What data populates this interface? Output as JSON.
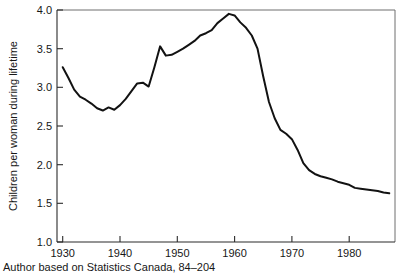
{
  "chart_data": {
    "type": "line",
    "title": "",
    "subtitle": "",
    "xlabel": "",
    "ylabel": "Children per woman during lifetime",
    "xlim": [
      1929,
      1988
    ],
    "ylim": [
      1.0,
      4.0
    ],
    "grid": false,
    "legend": "none",
    "line_color": "#121212",
    "axis_color": "#2b2b2b",
    "background_color": "#ffffff",
    "x_ticks": [
      1930,
      1940,
      1950,
      1960,
      1970,
      1980
    ],
    "x_tick_labels": [
      "1930",
      "1940",
      "1950",
      "1960",
      "1970",
      "1980"
    ],
    "y_ticks": [
      1.0,
      1.5,
      2.0,
      2.5,
      3.0,
      3.5,
      4.0
    ],
    "y_tick_labels": [
      "1.0",
      "1.5",
      "2.0",
      "2.5",
      "3.0",
      "3.5",
      "4.0"
    ],
    "series": [
      {
        "name": "Total fertility rate",
        "x": [
          1930,
          1931,
          1932,
          1933,
          1934,
          1935,
          1936,
          1937,
          1938,
          1939,
          1940,
          1941,
          1942,
          1943,
          1944,
          1945,
          1946,
          1947,
          1948,
          1949,
          1950,
          1951,
          1952,
          1953,
          1954,
          1955,
          1956,
          1957,
          1958,
          1959,
          1960,
          1961,
          1962,
          1963,
          1964,
          1965,
          1966,
          1967,
          1968,
          1969,
          1970,
          1971,
          1972,
          1973,
          1974,
          1975,
          1976,
          1977,
          1978,
          1979,
          1980,
          1981,
          1982,
          1983,
          1984,
          1985,
          1986,
          1987
        ],
        "y": [
          3.26,
          3.12,
          2.97,
          2.88,
          2.84,
          2.79,
          2.73,
          2.7,
          2.74,
          2.71,
          2.77,
          2.85,
          2.95,
          3.05,
          3.06,
          3.01,
          3.26,
          3.53,
          3.41,
          3.42,
          3.46,
          3.5,
          3.55,
          3.6,
          3.67,
          3.7,
          3.74,
          3.83,
          3.89,
          3.95,
          3.93,
          3.84,
          3.77,
          3.67,
          3.5,
          3.14,
          2.81,
          2.6,
          2.45,
          2.4,
          2.33,
          2.19,
          2.02,
          1.93,
          1.88,
          1.85,
          1.83,
          1.81,
          1.78,
          1.76,
          1.74,
          1.7,
          1.69,
          1.68,
          1.67,
          1.66,
          1.64,
          1.63
        ]
      }
    ],
    "source_note": "Author based on Statistics Canada, 84–204"
  },
  "axis": {
    "y_title": "Children per woman during lifetime"
  },
  "caption": {
    "text": "Author based on Statistics Canada, 84–204"
  }
}
